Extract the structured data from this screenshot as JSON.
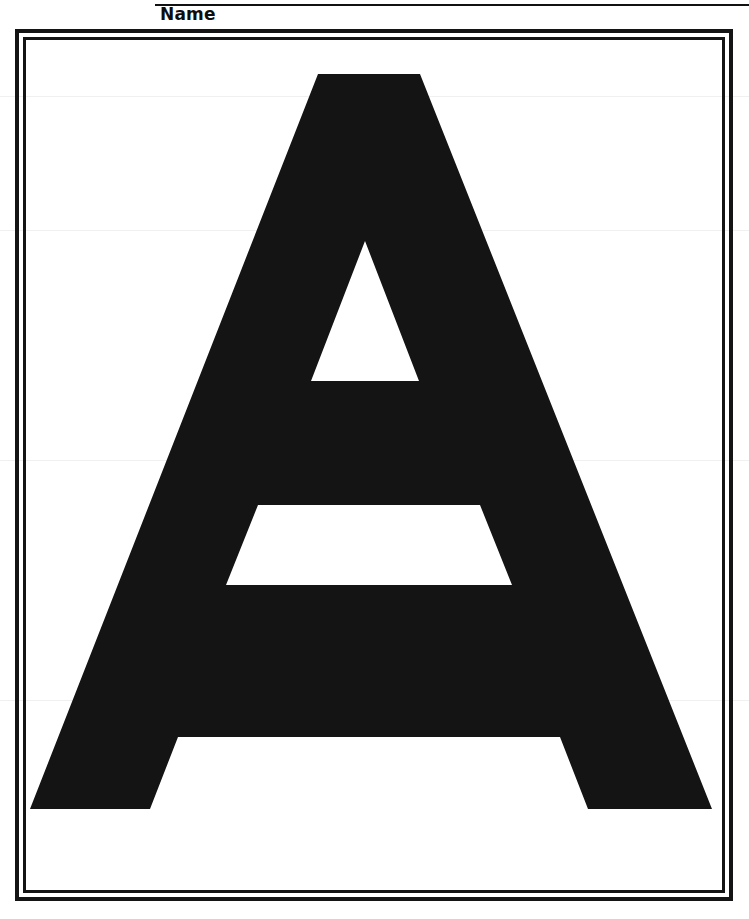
{
  "page": {
    "kind": "printable-worksheet",
    "width": 749,
    "height": 919,
    "background_color": "#ffffff",
    "ink_color": "#141414"
  },
  "header": {
    "name_label": "Name",
    "rule_present": true
  },
  "frame": {
    "style": "double-rule-rectangle",
    "outer_stroke_px": 4,
    "inner_stroke_px": 3,
    "color": "#141414"
  },
  "letter": {
    "character": "A",
    "case": "uppercase",
    "style": "outline",
    "fill_color": "#ffffff",
    "stroke_color": "#141414",
    "description": "Large block capital letter A with flat apex, triangular counter and trapezoidal crossbar",
    "outer_path": "M 318,74 L 420,74 L 712,809 L 588,809 L 560,737 L 178,737 L 150,809 L 30,809 Z",
    "counter_path": "M 365,241 L 419,381 L 311,381 Z",
    "bowl_path": "M 258,505 L 480,505 L 512,585 L 226,585 Z"
  },
  "icons": {
    "letter_glyph": "letter-a-outline"
  }
}
